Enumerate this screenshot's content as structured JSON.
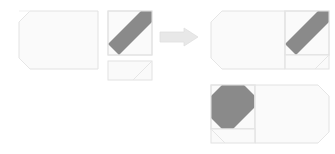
{
  "figure": {
    "type": "shape-assembly-puzzle",
    "title": "",
    "background_color": "#ffffff",
    "colors": {
      "light_fill": "#fafafa",
      "light_fill_alt": "#f7f7f7",
      "dark_fill": "#8a8a8a",
      "outline": "#e2e2e2",
      "outline_soft": "#ededed",
      "arrow_fill": "#e8e8e8",
      "arrow_outline": "#e0e0e0"
    },
    "labels": {
      "pieces_group": "",
      "results_group": "",
      "arrow": ""
    }
  },
  "pieces": [
    {
      "id": "piece-large-rectangle",
      "name": "large-octagon-rectangle",
      "description": "large light rectangle with diagonal cuts on left corners",
      "fill": "#fafafa",
      "outline": "#e2e2e2",
      "x": 19,
      "y": 11,
      "width": 79,
      "height": 58,
      "corner_cut": 11,
      "cut_corners": [
        "top-left",
        "bottom-left"
      ],
      "label": ""
    },
    {
      "id": "piece-diagonal-square",
      "name": "dark-diagonal-square",
      "description": "square tile with dark gray diagonal band running bottom-left to top-right",
      "fill": "#fafafa",
      "band_fill": "#8a8a8a",
      "outline": "#e2e2e2",
      "x": 108,
      "y": 11,
      "width": 44,
      "height": 44,
      "band_direction": "bottom-left-to-top-right",
      "label": ""
    },
    {
      "id": "piece-small-rectangle",
      "name": "small-diagonal-rectangle",
      "description": "small light rectangle with a single diagonal line in lower-right",
      "fill": "#fafafa",
      "outline": "#e2e2e2",
      "x": 108,
      "y": 61,
      "width": 44,
      "height": 19,
      "corner_cut": 11,
      "cut_corners": [
        "bottom-right"
      ],
      "label": ""
    }
  ],
  "arrow": {
    "name": "right-arrow",
    "direction": "right",
    "fill": "#e8e8e8",
    "outline": "#e0e0e0",
    "x": 160,
    "y": 28,
    "width": 38,
    "height": 18,
    "label": ""
  },
  "results": [
    {
      "id": "result-top",
      "name": "assembled-result-top",
      "description": "large rectangle on left with dark diagonal square attached at right",
      "x": 211,
      "y": 11,
      "width": 118,
      "height": 58,
      "dark_square_side": "right",
      "band_direction": "bottom-left-to-top-right",
      "label": ""
    },
    {
      "id": "result-bottom",
      "name": "assembled-result-bottom",
      "description": "dark diagonal square at left with large rectangle attached at right",
      "x": 211,
      "y": 85,
      "width": 118,
      "height": 58,
      "dark_square_side": "left",
      "band_direction": "bottom-left-to-top-right",
      "label": ""
    }
  ]
}
